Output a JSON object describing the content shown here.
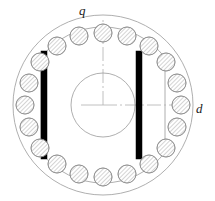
{
  "figure": {
    "background_color": "#ffffff"
  },
  "axes": {
    "d_axis": {
      "label": "d",
      "direction": "right",
      "arrow": true,
      "line_color": "#b0b0b0",
      "label_x": 196,
      "label_y": 113
    },
    "q_axis": {
      "label": "q",
      "direction": "up",
      "arrow": false,
      "line_color": "#b0b0b0",
      "label_x": 79,
      "label_y": 15
    },
    "center": {
      "x": 103,
      "y": 105
    }
  },
  "outer_boundary": {
    "name": "rotor-outer-circle",
    "cx": 103,
    "cy": 105,
    "r": 90,
    "stroke": "#9a9a9a",
    "stroke_width": 0.8,
    "fill": "none"
  },
  "inner_boundary": {
    "name": "rotor-lamination-outline",
    "stroke": "#9a9a9a",
    "stroke_width": 0.8,
    "fill": "none",
    "arc_radius": 78,
    "flat_x_left": 41,
    "flat_x_right": 165
  },
  "shaft": {
    "name": "rotor-shaft-circle",
    "cx": 103,
    "cy": 105,
    "r": 32,
    "stroke": "#9a9a9a",
    "stroke_width": 0.8,
    "fill": "none"
  },
  "magnets": {
    "fill": "#000000",
    "count": 2,
    "bars": [
      {
        "name": "magnet-left",
        "x": 41,
        "y": 51,
        "width": 6,
        "height": 108
      },
      {
        "name": "magnet-right",
        "x": 136,
        "y": 51,
        "width": 6,
        "height": 108
      }
    ]
  },
  "conductor_bars": {
    "count": 20,
    "radius": 9,
    "ring_radius": 78,
    "stroke": "#8a8a8a",
    "stroke_width": 0.7,
    "fill": "#ffffff",
    "hatch_color": "#9a9a9a",
    "hatch_angle_deg": 45,
    "positions": [
      {
        "cx": 103,
        "cy": 33
      },
      {
        "cx": 127,
        "cy": 36
      },
      {
        "cx": 149,
        "cy": 46
      },
      {
        "cx": 166,
        "cy": 62
      },
      {
        "cx": 177,
        "cy": 83
      },
      {
        "cx": 181,
        "cy": 105
      },
      {
        "cx": 177,
        "cy": 127
      },
      {
        "cx": 166,
        "cy": 148
      },
      {
        "cx": 149,
        "cy": 164
      },
      {
        "cx": 127,
        "cy": 174
      },
      {
        "cx": 103,
        "cy": 177
      },
      {
        "cx": 79,
        "cy": 174
      },
      {
        "cx": 57,
        "cy": 164
      },
      {
        "cx": 40,
        "cy": 148
      },
      {
        "cx": 29,
        "cy": 127
      },
      {
        "cx": 25,
        "cy": 105
      },
      {
        "cx": 29,
        "cy": 83
      },
      {
        "cx": 40,
        "cy": 62
      },
      {
        "cx": 57,
        "cy": 46
      },
      {
        "cx": 79,
        "cy": 36
      }
    ]
  }
}
